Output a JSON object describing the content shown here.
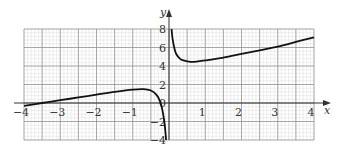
{
  "chart_data": {
    "type": "line",
    "title": "",
    "xlabel": "x",
    "ylabel": "y",
    "xlim": [
      -4,
      4
    ],
    "ylim": [
      -4,
      8
    ],
    "grid": true,
    "x_ticks": [
      -4,
      -3,
      -2,
      -1,
      1,
      2,
      3,
      4
    ],
    "x_tick_labels": [
      "−4",
      "−3",
      "−2",
      "−1",
      "1",
      "2",
      "3",
      "4"
    ],
    "y_ticks": [
      8,
      6,
      4,
      2,
      0,
      -2,
      -4
    ],
    "y_tick_labels": [
      "8",
      "6",
      "4",
      "2",
      "0",
      "−2",
      "−4"
    ],
    "series": [
      {
        "name": "left branch",
        "x": [
          -4,
          -3.5,
          -3,
          -2.5,
          -2,
          -1.5,
          -1,
          -0.7,
          -0.5,
          -0.35,
          -0.25,
          -0.18,
          -0.12,
          -0.08
        ],
        "y": [
          -0.3,
          0.0,
          0.3,
          0.6,
          0.9,
          1.2,
          1.45,
          1.5,
          1.35,
          0.9,
          0.2,
          -0.8,
          -2.3,
          -4
        ]
      },
      {
        "name": "right branch",
        "x": [
          0.07,
          0.1,
          0.15,
          0.2,
          0.3,
          0.4,
          0.6,
          0.8,
          1,
          1.5,
          2,
          2.5,
          3,
          3.5,
          4
        ],
        "y": [
          8,
          6.9,
          5.9,
          5.3,
          4.8,
          4.6,
          4.45,
          4.5,
          4.6,
          4.9,
          5.3,
          5.7,
          6.1,
          6.6,
          7.1
        ]
      }
    ]
  }
}
